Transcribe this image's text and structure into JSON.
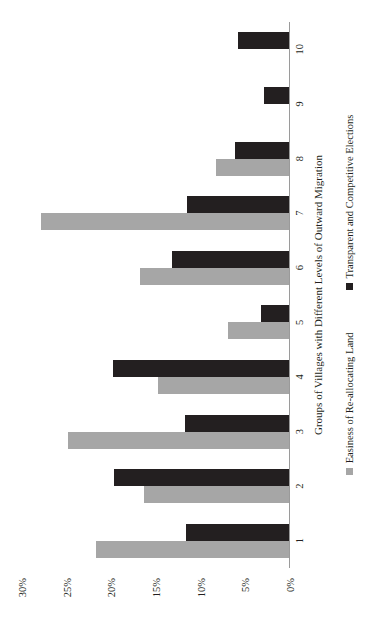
{
  "chart_data": {
    "type": "bar",
    "orientation": "vertical-rendered-sideways",
    "title": "",
    "xlabel": "Groups of Villages with Different Levels of Outward Migration",
    "ylabel": "",
    "categories": [
      "1",
      "2",
      "3",
      "4",
      "5",
      "6",
      "7",
      "8",
      "9",
      "10"
    ],
    "ylim": [
      0,
      30
    ],
    "yticks": [
      0,
      5,
      10,
      15,
      20,
      25,
      30
    ],
    "ytick_labels": [
      "0%",
      "5%",
      "10%",
      "15%",
      "20%",
      "25%",
      "30%"
    ],
    "grid": false,
    "legend_position": "bottom",
    "series": [
      {
        "name": "Easiness of Re-allocating Land",
        "color": "#a6a6a6",
        "values": [
          21.7,
          16.3,
          24.9,
          14.8,
          6.9,
          16.8,
          27.9,
          8.3,
          0,
          0
        ]
      },
      {
        "name": "Transparent and Competitive Elections",
        "color": "#231f20",
        "values": [
          11.6,
          19.7,
          11.7,
          19.8,
          3.2,
          13.2,
          11.5,
          6.2,
          2.9,
          5.8
        ]
      }
    ]
  },
  "axis": {
    "category_title": "Groups of Villages with Different Levels of Outward Migration"
  },
  "legend": {
    "items": [
      {
        "label": "Easiness of Re-allocating Land",
        "color": "#a6a6a6"
      },
      {
        "label": "Transparent and Competitive Elections",
        "color": "#231f20"
      }
    ]
  }
}
